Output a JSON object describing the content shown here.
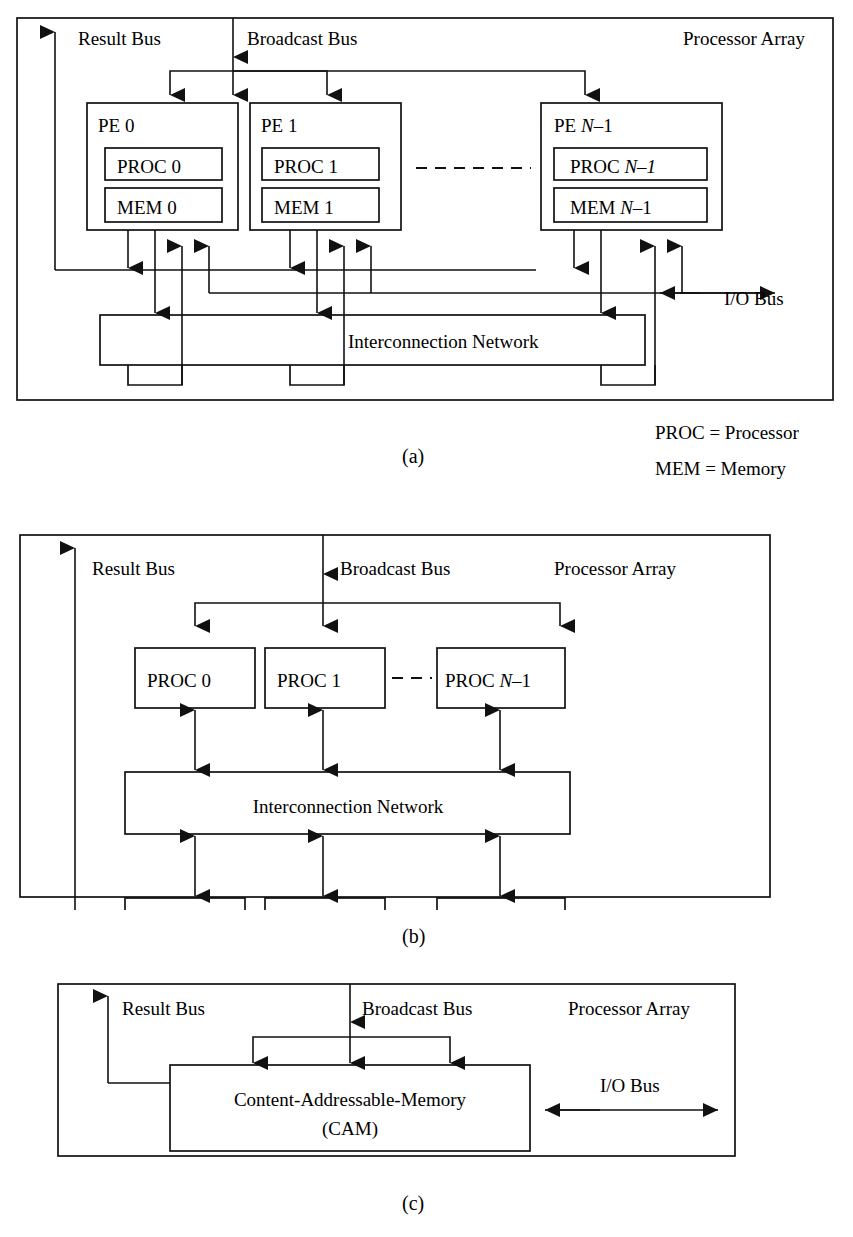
{
  "figure": {
    "caption_a": "(a)",
    "caption_b": "(b)",
    "caption_c": "(c)"
  },
  "legend": {
    "proc_line": "PROC = Processor",
    "mem_line": "MEM  = Memory"
  },
  "panel_a": {
    "outer_label": "Processor Array",
    "result_bus": "Result Bus",
    "broadcast_bus": "Broadcast Bus",
    "io_bus": "I/O Bus",
    "network": "Interconnection Network",
    "pes": [
      {
        "title_prefix": "PE ",
        "title_index": "0",
        "title_index_italic": false,
        "proc_prefix": "PROC ",
        "proc_index": "0",
        "proc_index_italic": false,
        "mem_prefix": "MEM ",
        "mem_index": "0",
        "mem_index_italic": false
      },
      {
        "title_prefix": "PE ",
        "title_index": "1",
        "title_index_italic": false,
        "proc_prefix": "PROC ",
        "proc_index": "1",
        "proc_index_italic": false,
        "mem_prefix": "MEM ",
        "mem_index": "1",
        "mem_index_italic": false
      },
      {
        "title_prefix": "PE ",
        "title_index": "N",
        "title_suffix": "–1",
        "title_index_italic": true,
        "proc_prefix": "PROC ",
        "proc_index": "N–1",
        "proc_index_italic": true,
        "mem_prefix": "MEM ",
        "mem_index": "N",
        "mem_suffix": "–1",
        "mem_index_italic": true
      }
    ],
    "ellipsis": "dashed-line"
  },
  "panel_b": {
    "outer_label": "Processor Array",
    "result_bus": "Result Bus",
    "broadcast_bus": "Broadcast Bus",
    "io_bus": "I/O Bus",
    "network": "Interconnection Network",
    "procs": [
      {
        "prefix": "PROC ",
        "index": "0",
        "italic": false
      },
      {
        "prefix": "PROC ",
        "index": "1",
        "italic": false
      },
      {
        "prefix": "PROC ",
        "index": "N",
        "suffix": "–1",
        "italic": true
      }
    ],
    "mems": [
      {
        "prefix": "MEM ",
        "index": "0",
        "italic": false
      },
      {
        "prefix": "MEM ",
        "index": "1",
        "italic": false
      },
      {
        "prefix": "MEM ",
        "index": "M",
        "suffix": "–1",
        "italic": true
      }
    ]
  },
  "panel_c": {
    "outer_label": "Processor Array",
    "result_bus": "Result Bus",
    "broadcast_bus": "Broadcast Bus",
    "io_bus": "I/O Bus",
    "cam_line1": "Content-Addressable-Memory",
    "cam_line2": "(CAM)"
  }
}
